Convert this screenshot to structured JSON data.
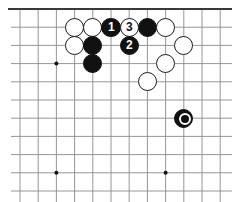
{
  "diagram": {
    "kind": "go-board-diagram",
    "caption": "",
    "board": {
      "width": 232,
      "height": 202,
      "origin_x": 20,
      "origin_y": 9,
      "spacing": 18.2,
      "cols": 12,
      "rows": 10,
      "line_color": "#8a8a8a",
      "edge_color": "#3a3a3a",
      "edge_width": 2.2,
      "line_width": 0.9,
      "background": "#ffffff",
      "top_edge": true,
      "right_edge": true,
      "bottom_edge": false,
      "left_edge": false
    },
    "star_points": [
      {
        "col": 2,
        "row": 3
      },
      {
        "col": 8,
        "row": 3
      },
      {
        "col": 2,
        "row": 9
      },
      {
        "col": 8,
        "row": 9
      }
    ],
    "star_radius": 2.0,
    "stone_radius": 9.6,
    "label_font_size": 12,
    "marker_outer_radius": 6.2,
    "marker_inner_radius": 2.6,
    "stones": [
      {
        "id": "w-a",
        "color": "white",
        "col": 3,
        "row": 1,
        "label": "",
        "marked": false
      },
      {
        "id": "w-b",
        "color": "white",
        "col": 4,
        "row": 1,
        "label": "",
        "marked": false
      },
      {
        "id": "b-c",
        "color": "black",
        "col": 5,
        "row": 1,
        "label": "1",
        "marked": false
      },
      {
        "id": "w-d",
        "color": "white",
        "col": 6,
        "row": 1,
        "label": "3",
        "marked": false
      },
      {
        "id": "b-e",
        "color": "black",
        "col": 7,
        "row": 1,
        "label": "",
        "marked": false
      },
      {
        "id": "w-f",
        "color": "white",
        "col": 8,
        "row": 1,
        "label": "",
        "marked": false
      },
      {
        "id": "w-g",
        "color": "white",
        "col": 3,
        "row": 2,
        "label": "",
        "marked": false
      },
      {
        "id": "b-h",
        "color": "black",
        "col": 4,
        "row": 2,
        "label": "",
        "marked": false
      },
      {
        "id": "b-i",
        "color": "black",
        "col": 6,
        "row": 2,
        "label": "2",
        "marked": false
      },
      {
        "id": "w-j",
        "color": "white",
        "col": 9,
        "row": 2,
        "label": "",
        "marked": false
      },
      {
        "id": "b-k",
        "color": "black",
        "col": 4,
        "row": 3,
        "label": "",
        "marked": false
      },
      {
        "id": "w-l",
        "color": "white",
        "col": 8,
        "row": 3,
        "label": "",
        "marked": false
      },
      {
        "id": "w-m",
        "color": "white",
        "col": 7,
        "row": 4,
        "label": "",
        "marked": false
      },
      {
        "id": "b-n",
        "color": "black",
        "col": 9,
        "row": 6,
        "label": "",
        "marked": true
      }
    ],
    "moves": [
      {
        "number": "1",
        "color": "black",
        "col": 5,
        "row": 1
      },
      {
        "number": "2",
        "color": "black",
        "col": 6,
        "row": 2
      },
      {
        "number": "3",
        "color": "white",
        "col": 6,
        "row": 1
      }
    ]
  }
}
